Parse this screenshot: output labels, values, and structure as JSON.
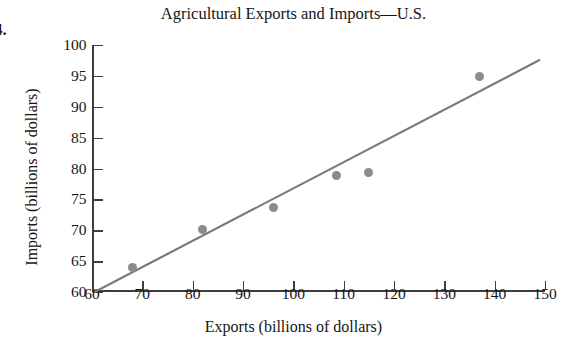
{
  "exercise_number": "4.",
  "bleed_text": "",
  "chart_data": {
    "type": "scatter",
    "title": "Agricultural Exports and Imports—U.S.",
    "xlabel": "Exports (billions of dollars)",
    "ylabel": "Imports (billions of dollars)",
    "xlim": [
      60,
      150
    ],
    "ylim": [
      60,
      100
    ],
    "xticks": [
      60,
      70,
      80,
      90,
      100,
      110,
      120,
      130,
      140,
      150
    ],
    "yticks": [
      60,
      65,
      70,
      75,
      80,
      85,
      90,
      95,
      100
    ],
    "xtick_labels": [
      "60",
      "70",
      "80",
      "90",
      "100",
      "110",
      "120",
      "130",
      "140",
      "150"
    ],
    "ytick_labels": [
      "60",
      "65",
      "70",
      "75",
      "80",
      "85",
      "90",
      "95",
      "100"
    ],
    "grid": false,
    "legend": null,
    "series": [
      {
        "name": "Exports vs Imports",
        "marker": "circle",
        "color": "#8b8b8b",
        "points": [
          {
            "x": 68,
            "y": 64
          },
          {
            "x": 82,
            "y": 70.1
          },
          {
            "x": 96,
            "y": 73.7
          },
          {
            "x": 108.5,
            "y": 78.8
          },
          {
            "x": 115,
            "y": 79.4
          },
          {
            "x": 137,
            "y": 94.9
          }
        ]
      }
    ],
    "trend_line": {
      "name": "line of best fit",
      "color": "#7b7b7b",
      "x_start": 60.5,
      "y_start": 60,
      "x_end": 149,
      "y_end": 97.6
    }
  }
}
